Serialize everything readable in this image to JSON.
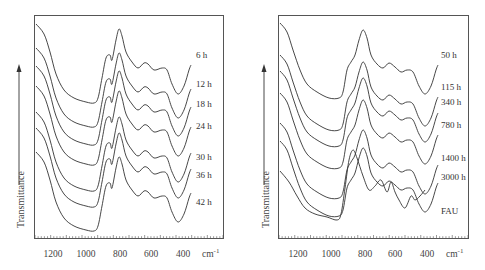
{
  "chart_data": [
    {
      "type": "line",
      "title": "",
      "xlabel": "cm-1",
      "ylabel": "Transmittance",
      "x_axis": {
        "reversed": true,
        "ticks": [
          1200,
          1000,
          800,
          600,
          400
        ],
        "unit": "cm⁻¹",
        "xlim": [
          1350,
          350
        ]
      },
      "grid": false,
      "legend": "inline labels at right end of each curve",
      "frame": {
        "x0": 34,
        "y0": 15,
        "x1": 223,
        "y1": 238
      },
      "series": [
        {
          "name": "6 h",
          "label_y": 55,
          "offset": 0
        },
        {
          "name": "12 h",
          "label_y": 84,
          "offset": 24
        },
        {
          "name": "18 h",
          "label_y": 104,
          "offset": 42
        },
        {
          "name": "24 h",
          "label_y": 126,
          "offset": 62
        },
        {
          "name": "30 h",
          "label_y": 157,
          "offset": 88
        },
        {
          "name": "36 h",
          "label_y": 175,
          "offset": 104
        },
        {
          "name": "42 h",
          "label_y": 202,
          "offset": 128
        }
      ],
      "profile": "zeolite-P"
    },
    {
      "type": "line",
      "title": "",
      "xlabel": "cm-1",
      "ylabel": "Transmittance",
      "x_axis": {
        "reversed": true,
        "ticks": [
          1200,
          1000,
          800,
          600,
          400
        ],
        "unit": "cm⁻¹",
        "xlim": [
          1350,
          350
        ]
      },
      "grid": false,
      "legend": "inline labels at right end of each curve",
      "frame": {
        "x0": 33,
        "y0": 15,
        "x1": 223,
        "y1": 238
      },
      "series": [
        {
          "name": "50 h",
          "label_y": 55,
          "offset": 0
        },
        {
          "name": "115 h",
          "label_y": 87,
          "offset": 32
        },
        {
          "name": "340 h",
          "label_y": 102,
          "offset": 48
        },
        {
          "name": "780 h",
          "label_y": 125,
          "offset": 70
        },
        {
          "name": "1400 h",
          "label_y": 158,
          "offset": 100
        },
        {
          "name": "3000 h",
          "label_y": 177,
          "offset": 118
        },
        {
          "name": "FAU",
          "label_y": 211,
          "offset": 150
        }
      ],
      "profile": "faujasite"
    }
  ],
  "axis_labels": {
    "ylabel": "Transmittance",
    "unit": "cm",
    "unit_sup": "-1",
    "ticks": [
      "1200",
      "1000",
      "800",
      "600",
      "400"
    ]
  },
  "left": {
    "labels": [
      "6 h",
      "12 h",
      "18 h",
      "24 h",
      "30 h",
      "36 h",
      "42 h"
    ]
  },
  "right": {
    "labels": [
      "50 h",
      "115 h",
      "340 h",
      "780 h",
      "1400 h",
      "3000 h",
      "FAU"
    ]
  }
}
